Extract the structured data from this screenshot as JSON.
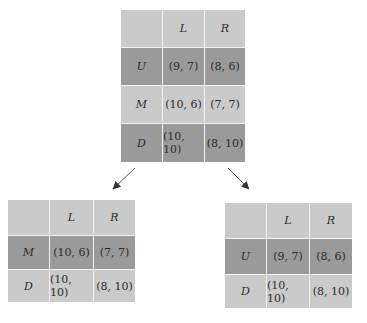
{
  "diagram": {
    "type": "game-reduction",
    "top_matrix": {
      "columns": [
        "",
        "L",
        "R"
      ],
      "rows": [
        {
          "label": "U",
          "cells": [
            "(9, 7)",
            "(8, 6)"
          ],
          "shade": "dark"
        },
        {
          "label": "M",
          "cells": [
            "(10, 6)",
            "(7, 7)"
          ],
          "shade": "light"
        },
        {
          "label": "D",
          "cells": [
            "(10, 10)",
            "(8, 10)"
          ],
          "shade": "dark"
        }
      ]
    },
    "left_matrix": {
      "columns": [
        "",
        "L",
        "R"
      ],
      "rows": [
        {
          "label": "M",
          "cells": [
            "(10, 6)",
            "(7, 7)"
          ],
          "shade": "dark"
        },
        {
          "label": "D",
          "cells": [
            "(10, 10)",
            "(8, 10)"
          ],
          "shade": "light"
        }
      ]
    },
    "right_matrix": {
      "columns": [
        "",
        "L",
        "R"
      ],
      "rows": [
        {
          "label": "U",
          "cells": [
            "(9, 7)",
            "(8, 6)"
          ],
          "shade": "dark"
        },
        {
          "label": "D",
          "cells": [
            "(10, 10)",
            "(8, 10)"
          ],
          "shade": "light"
        }
      ]
    },
    "arrows": [
      {
        "from": "top_matrix",
        "to": "left_matrix",
        "direction": "down-left"
      },
      {
        "from": "top_matrix",
        "to": "right_matrix",
        "direction": "down-right"
      }
    ],
    "colors": {
      "light_cell": "#cacaca",
      "dark_cell": "#9a9a9a",
      "grid_line": "#f4f4f4",
      "arrow": "#333333"
    }
  }
}
